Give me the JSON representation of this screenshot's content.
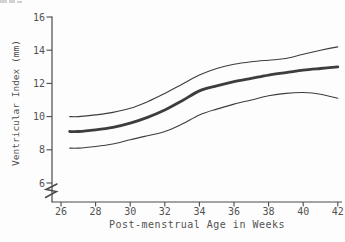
{
  "chart_data": {
    "type": "line",
    "title": "",
    "xlabel": "Post-menstrual Age in Weeks",
    "ylabel": "Ventricular Index (mm)",
    "x_ticks": [
      26,
      28,
      30,
      32,
      34,
      36,
      38,
      40,
      42
    ],
    "y_ticks": [
      6,
      8,
      10,
      12,
      14,
      16
    ],
    "xlim": [
      25.5,
      42.3
    ],
    "ylim": [
      6,
      16
    ],
    "y_axis_break_below": 6,
    "grid": false,
    "legend": "none",
    "x": [
      26.5,
      27,
      28,
      29,
      30,
      31,
      32,
      33,
      34,
      35,
      36,
      37,
      38,
      39,
      40,
      41,
      42
    ],
    "series": [
      {
        "name": "upper-limit",
        "stroke_width": 1.1,
        "values": [
          10.0,
          10.0,
          10.1,
          10.25,
          10.5,
          10.9,
          11.4,
          11.95,
          12.5,
          12.9,
          13.15,
          13.3,
          13.4,
          13.5,
          13.75,
          14.0,
          14.2
        ]
      },
      {
        "name": "mean",
        "stroke_width": 2.8,
        "values": [
          9.1,
          9.1,
          9.2,
          9.35,
          9.6,
          9.95,
          10.4,
          10.95,
          11.55,
          11.85,
          12.1,
          12.3,
          12.5,
          12.65,
          12.8,
          12.9,
          13.0
        ]
      },
      {
        "name": "lower-limit",
        "stroke_width": 1.1,
        "values": [
          8.1,
          8.1,
          8.2,
          8.35,
          8.6,
          8.85,
          9.1,
          9.55,
          10.1,
          10.45,
          10.75,
          11.0,
          11.25,
          11.4,
          11.45,
          11.35,
          11.1
        ]
      }
    ],
    "style": {
      "curve_color": "#3d3d3d",
      "axis_color": "#4a4a4a",
      "text_color": "#525252",
      "background": "#fdfdfd"
    }
  }
}
